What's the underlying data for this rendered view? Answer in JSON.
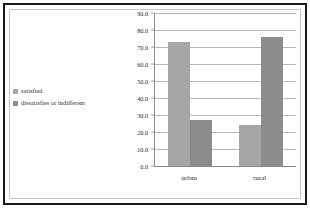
{
  "chart_data": {
    "type": "bar",
    "title": "",
    "xlabel": "",
    "ylabel": "",
    "categories": [
      "urban",
      "rural"
    ],
    "series": [
      {
        "name": "satisfied",
        "values": [
          73.0,
          24.0
        ],
        "color": "#a6a6a6"
      },
      {
        "name": "dissatisfies or indifferent",
        "values": [
          27.0,
          76.0
        ],
        "color": "#8c8c8c"
      }
    ],
    "ylim": [
      0.0,
      90.0
    ],
    "ytick_step": 10.0,
    "ytick_labels": [
      "90.0",
      "80.0",
      "70.0",
      "60.0",
      "50.0",
      "40.0",
      "30.0",
      "20.0",
      "10.0",
      "0.0"
    ],
    "ytick_values": [
      90.0,
      80.0,
      70.0,
      60.0,
      50.0,
      40.0,
      30.0,
      20.0,
      10.0,
      0.0
    ],
    "grid": true,
    "legend_position": "left"
  },
  "legend": {
    "items": [
      {
        "label": "satisfied",
        "color": "#a6a6a6"
      },
      {
        "label": "dissatisfies or indifferent",
        "color": "#8c8c8c"
      }
    ]
  },
  "colors": {
    "frame_outer": "#1a1a1a",
    "frame_inner": "#c8c8c8",
    "gridline": "#b9b9b9",
    "axis": "#8a8a8a",
    "background": "#ffffff",
    "text": "#2b2b2b"
  }
}
